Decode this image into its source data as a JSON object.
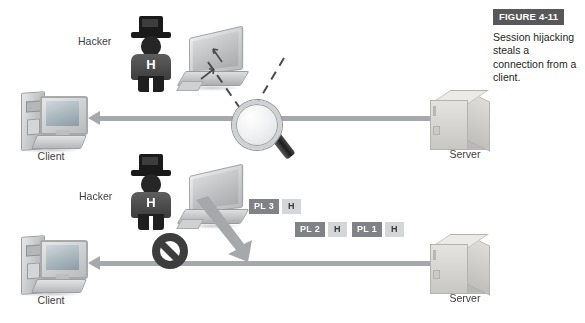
{
  "figure": {
    "badge_label": "FIGURE 4-11",
    "caption": "Session hijacking steals a connection from a client.",
    "badge_color": "#58585a"
  },
  "diagram": {
    "type": "network-attack-diagram",
    "scenario_rows": [
      {
        "row": "top",
        "description": "Hacker sniffs the client-server connection",
        "nodes": [
          "client",
          "hacker",
          "laptop",
          "magnifier",
          "server"
        ],
        "connection": "bidirectional-arrow-client-server",
        "connection_state": "active"
      },
      {
        "row": "bottom",
        "description": "Hacker injects packets and the client connection is blocked",
        "nodes": [
          "client",
          "hacker",
          "laptop",
          "no-entry-sign",
          "packets",
          "server"
        ],
        "connection": "bidirectional-arrow-client-server",
        "connection_state": "blocked"
      }
    ],
    "labels": {
      "client": "Client",
      "server": "Server",
      "hacker": "Hacker",
      "hacker_badge": "H"
    },
    "packets": [
      {
        "payload": "PL 3",
        "header": "H"
      },
      {
        "payload": "PL 2",
        "header": "H"
      },
      {
        "payload": "PL 1",
        "header": "H"
      }
    ],
    "colors": {
      "arrow": "#a6a8ab",
      "packet_payload": "#808285",
      "packet_header": "#d5d6d8",
      "hacker_body": "#4b4b4b",
      "no_entry": "#3d3d3d",
      "background": "#ffffff"
    },
    "icons": {
      "client": "desktop-computer-icon",
      "server": "server-box-icon",
      "hacker": "hacker-person-icon",
      "laptop": "laptop-icon",
      "magnifier": "magnifying-glass-icon",
      "blocked": "no-entry-icon"
    }
  }
}
